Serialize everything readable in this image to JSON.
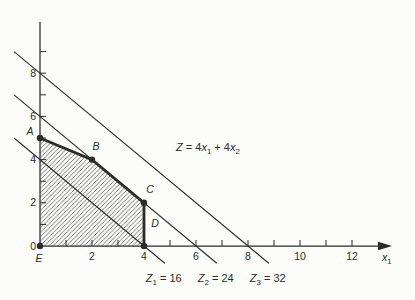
{
  "figure": {
    "background": "#fcfcfa",
    "ink": "#2b2b2b",
    "hatch_color": "#4a4a4a"
  },
  "chart_data": {
    "type": "line",
    "title": "",
    "subtitle": "",
    "xlabel": "x₁",
    "ylabel": "",
    "xlim": [
      0,
      13.5
    ],
    "ylim": [
      0,
      10.4
    ],
    "grid": false,
    "legend": "none",
    "objective_label": "Z = 4x₁ + 4x₂",
    "objective_parts": [
      [
        "Z",
        "i"
      ],
      [
        " = 4",
        "n"
      ],
      [
        "x",
        "i"
      ],
      [
        "1",
        "s"
      ],
      [
        " + 4",
        "n"
      ],
      [
        "x",
        "i"
      ],
      [
        "2",
        "s"
      ]
    ],
    "xlabel_parts": [
      [
        "x",
        "i"
      ],
      [
        "1",
        "s"
      ]
    ],
    "feasible_region": {
      "fill": "diagonal-hatch",
      "vertices": [
        {
          "label": "A",
          "x": 0,
          "y": 5
        },
        {
          "label": "B",
          "x": 2,
          "y": 4
        },
        {
          "label": "C",
          "x": 4,
          "y": 2
        },
        {
          "label": "D",
          "x": 4,
          "y": 0
        },
        {
          "label": "E",
          "x": 0,
          "y": 0
        }
      ],
      "thick_boundary": [
        "A",
        "B",
        "C",
        "D"
      ]
    },
    "iso_profit_lines": [
      {
        "label": "Z₁ = 16",
        "parts": [
          [
            "Z",
            "i"
          ],
          [
            "1",
            "s"
          ],
          [
            " = 16",
            "n"
          ]
        ],
        "z": 16,
        "x_intercept": 4,
        "y_intercept": 4
      },
      {
        "label": "Z₂ = 24",
        "parts": [
          [
            "Z",
            "i"
          ],
          [
            "2",
            "s"
          ],
          [
            " = 24",
            "n"
          ]
        ],
        "z": 24,
        "x_intercept": 6,
        "y_intercept": 6
      },
      {
        "label": "Z₃ = 32",
        "parts": [
          [
            "Z",
            "i"
          ],
          [
            "3",
            "s"
          ],
          [
            " = 32",
            "n"
          ]
        ],
        "z": 32,
        "x_intercept": 8,
        "y_intercept": 8
      }
    ],
    "x_ticks_minor": [
      1,
      2,
      3,
      4,
      5,
      6,
      7,
      8,
      9,
      10,
      11,
      12
    ],
    "x_tick_labels": [
      2,
      4,
      6,
      8,
      10,
      12
    ],
    "y_ticks_minor": [
      1,
      2,
      3,
      4,
      5,
      6,
      7,
      8,
      9
    ],
    "y_tick_labels": [
      0,
      2,
      4,
      6,
      8
    ]
  }
}
